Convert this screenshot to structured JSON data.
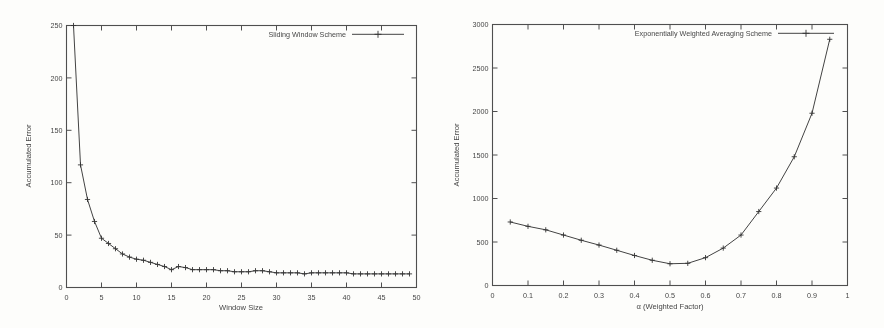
{
  "figure": {
    "background_color": "#fdfdfb",
    "ink_color": "#3d3d3d",
    "panel_count": 2
  },
  "chart_data": [
    {
      "type": "line",
      "panel": "left",
      "title": "",
      "xlabel": "Window Size",
      "ylabel": "Accumulated Error",
      "xlim": [
        0,
        50
      ],
      "ylim": [
        0,
        250
      ],
      "xticks": [
        0,
        5,
        10,
        15,
        20,
        25,
        30,
        35,
        40,
        45,
        50
      ],
      "xticklabels": [
        "0",
        "5",
        "10",
        "15",
        "20",
        "25",
        "30",
        "35",
        "40",
        "45",
        "50"
      ],
      "yticks": [
        0,
        50,
        100,
        150,
        200,
        250
      ],
      "yticklabels": [
        "0",
        "50",
        "100",
        "150",
        "200",
        "250"
      ],
      "grid": false,
      "legend_position": "top-right",
      "legend": [
        "Sliding Window Scheme"
      ],
      "marker": "plus",
      "series": [
        {
          "name": "Sliding Window Scheme",
          "x": [
            1,
            2,
            3,
            4,
            5,
            6,
            7,
            8,
            9,
            10,
            11,
            12,
            13,
            14,
            15,
            16,
            17,
            18,
            19,
            20,
            21,
            22,
            23,
            24,
            25,
            26,
            27,
            28,
            29,
            30,
            31,
            32,
            33,
            34,
            35,
            36,
            37,
            38,
            39,
            40,
            41,
            42,
            43,
            44,
            45,
            46,
            47,
            48,
            49
          ],
          "values": [
            250,
            117,
            84,
            63,
            47,
            42,
            37,
            32,
            29,
            27,
            26,
            24,
            22,
            20,
            17,
            20,
            19,
            17,
            17,
            17,
            17,
            16,
            16,
            15,
            15,
            15,
            16,
            16,
            15,
            14,
            14,
            14,
            14,
            13,
            14,
            14,
            14,
            14,
            14,
            14,
            13,
            13,
            13,
            13,
            13,
            13,
            13,
            13,
            13
          ]
        }
      ]
    },
    {
      "type": "line",
      "panel": "right",
      "title": "",
      "xlabel": "α (Weighted Factor)",
      "ylabel": "Accumulated Error",
      "xlim": [
        0,
        1
      ],
      "ylim": [
        0,
        3000
      ],
      "xticks": [
        0,
        0.1,
        0.2,
        0.3,
        0.4,
        0.5,
        0.6,
        0.7,
        0.8,
        0.9,
        1
      ],
      "xticklabels": [
        "0",
        "0.1",
        "0.2",
        "0.3",
        "0.4",
        "0.5",
        "0.6",
        "0.7",
        "0.8",
        "0.9",
        "1"
      ],
      "yticks": [
        0,
        500,
        1000,
        1500,
        2000,
        2500,
        3000
      ],
      "yticklabels": [
        "0",
        "500",
        "1000",
        "1500",
        "2000",
        "2500",
        "3000"
      ],
      "grid": false,
      "legend_position": "top-right",
      "legend": [
        "Exponentially Weighted Averaging Scheme"
      ],
      "marker": "plus",
      "series": [
        {
          "name": "Exponentially Weighted Averaging Scheme",
          "x": [
            0.05,
            0.1,
            0.15,
            0.2,
            0.25,
            0.3,
            0.35,
            0.4,
            0.45,
            0.5,
            0.55,
            0.6,
            0.65,
            0.7,
            0.75,
            0.8,
            0.85,
            0.9,
            0.95
          ],
          "values": [
            730,
            680,
            640,
            580,
            520,
            465,
            405,
            345,
            290,
            250,
            255,
            320,
            430,
            580,
            850,
            1120,
            1480,
            1980,
            2830
          ]
        }
      ]
    }
  ]
}
